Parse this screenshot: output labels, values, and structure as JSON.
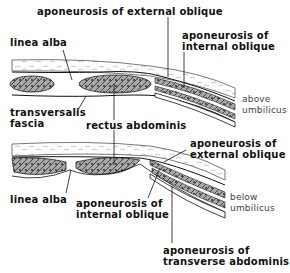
{
  "diagram": {
    "colors": {
      "ink": "#111111",
      "muscle_fill": "#8a8a8a",
      "background": "#ffffff"
    },
    "panels": [
      {
        "id": "above",
        "region_label_line1": "above",
        "region_label_line2": "umbilicus",
        "labels": {
          "ext_oblique": "aponeurosis of external oblique",
          "int_oblique_line1": "aponeurosis of",
          "int_oblique_line2": "internal oblique",
          "linea_alba": "linea alba",
          "transversalis_line1": "transversalis",
          "transversalis_line2": "fascia",
          "rectus": "rectus abdominis"
        }
      },
      {
        "id": "below",
        "region_label_line1": "below",
        "region_label_line2": "umbilicus",
        "labels": {
          "ext_oblique_line1": "aponeurosis of",
          "ext_oblique_line2": "external oblique",
          "linea_alba": "linea alba",
          "int_oblique_line1": "aponeurosis of",
          "int_oblique_line2": "internal oblique",
          "transverse_line1": "aponeurosis of",
          "transverse_line2": "transverse abdominis"
        }
      }
    ]
  }
}
